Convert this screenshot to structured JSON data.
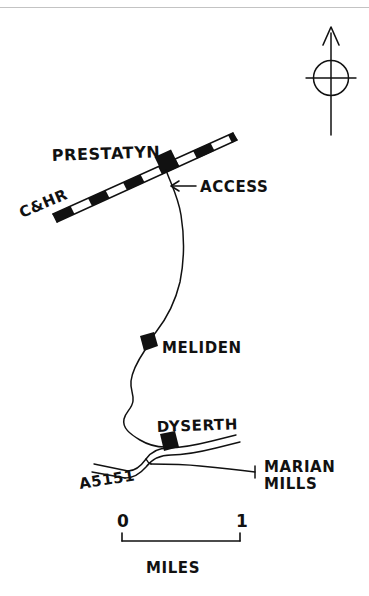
{
  "map": {
    "title": "Dyserth Branch Line Sketch Map",
    "figure_type": "hand-drawn railway sketch map",
    "orientation": "north-up",
    "compass": {
      "name": "north-arrow",
      "points_to": "N"
    },
    "stations": [
      {
        "id": "prestatyn",
        "label": "PRESTATYN",
        "marker": "filled-square",
        "x": 163,
        "y": 162,
        "label_x": 52,
        "label_y": 157
      },
      {
        "id": "meliden",
        "label": "MELIDEN",
        "marker": "filled-diamond",
        "x": 148,
        "y": 344,
        "label_x": 162,
        "label_y": 352
      },
      {
        "id": "dyserth",
        "label": "DYSERTH",
        "marker": "filled-diamond",
        "x": 168,
        "y": 443,
        "label_x": 158,
        "label_y": 429
      }
    ],
    "annotations": [
      {
        "id": "access",
        "label": "ACCESS",
        "arrow": "left-arrow",
        "x": 196,
        "y": 190
      },
      {
        "id": "chr",
        "label": "C&HR",
        "rotation_deg": -23,
        "x": 22,
        "y": 214
      },
      {
        "id": "a5151",
        "label": "A5151",
        "rotation_deg": -8,
        "x": 82,
        "y": 487
      },
      {
        "id": "marian-mills-line1",
        "label": "MARIAN",
        "x": 265,
        "y": 468
      },
      {
        "id": "marian-mills-line2",
        "label": "MILLS",
        "x": 265,
        "y": 486
      }
    ],
    "scale_bar": {
      "start_label": "0",
      "end_label": "1",
      "units_label": "MILES",
      "start_x": 122,
      "end_x": 240,
      "y": 541,
      "value_min": 0,
      "value_max": 1,
      "units": "miles"
    },
    "features": {
      "main_line_name": "C&HR",
      "branch_name": "Dyserth Branch",
      "road_name": "A5151",
      "destination": "MARIAN MILLS"
    }
  },
  "colors": {
    "ink": "#111111",
    "paper": "#ffffff",
    "scan_artifact": "#b9b9b9"
  }
}
